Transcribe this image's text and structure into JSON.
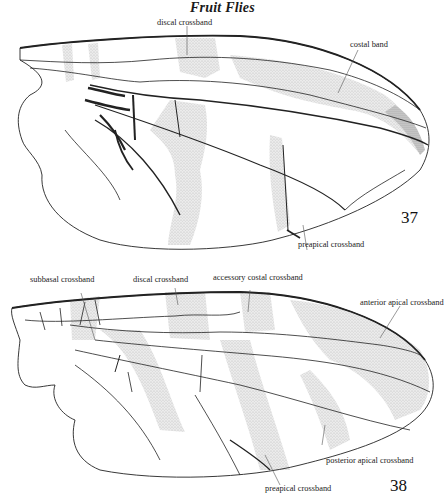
{
  "page": {
    "running_title": "Fruit Flies"
  },
  "figures": [
    {
      "number": "37",
      "labels": {
        "discal_crossband": "discal crossband",
        "costal_band": "costal band",
        "preapical_crossband": "preapical crossband"
      }
    },
    {
      "number": "38",
      "labels": {
        "subbasal_crossband": "subbasal crossband",
        "discal_crossband": "discal crossband",
        "accessory_costal_crossband": "accessory costal crossband",
        "anterior_apical_crossband": "anterior apical crossband",
        "posterior_apical_crossband": "posterior apical crossband",
        "preapical_crossband": "preapical crossband"
      }
    }
  ],
  "colors": {
    "ink": "#1a1a1a",
    "stipple": "#d4d4d4",
    "background": "#ffffff"
  }
}
